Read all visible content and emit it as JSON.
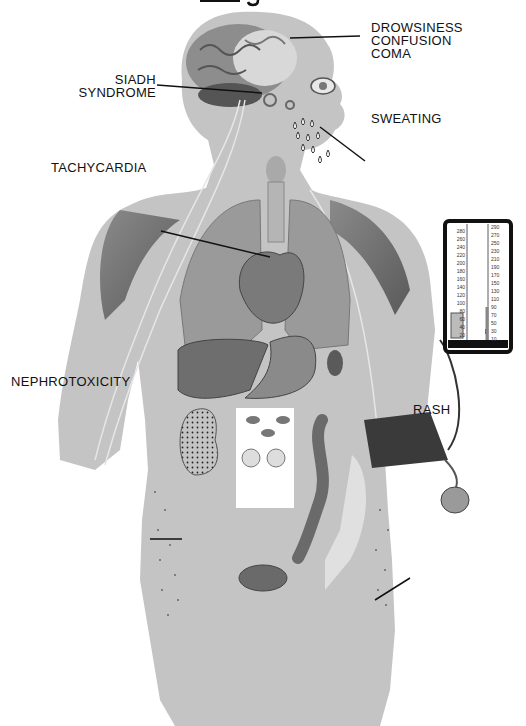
{
  "title_fragment": "g",
  "labels": {
    "brain": [
      "DROWSINESS",
      "CONFUSION",
      "COMA"
    ],
    "siadh": [
      "SIADH",
      "SYNDROME"
    ],
    "sweating": "SWEATING",
    "tachycardia": "TACHYCARDIA",
    "nephrotoxicity": "NEPHROTOXICITY",
    "rash": "RASH"
  },
  "sphygmomanometer": {
    "left_scale": [
      "280",
      "260",
      "240",
      "220",
      "200",
      "180",
      "160",
      "140",
      "120",
      "100",
      "80",
      "60",
      "40",
      "20"
    ],
    "right_scale": [
      "290",
      "270",
      "250",
      "230",
      "210",
      "190",
      "170",
      "150",
      "130",
      "110",
      "90",
      "70",
      "50",
      "30",
      "10"
    ],
    "mercury_level": 110
  },
  "colors": {
    "body": "#c4c4c4",
    "organ_dark": "#6e6e6e",
    "organ_mid": "#959595",
    "text": "#111111",
    "cuff": "#3a3a3a"
  }
}
